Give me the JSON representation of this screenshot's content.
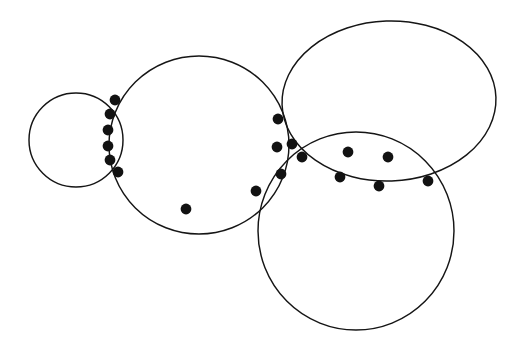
{
  "figure": {
    "background_color": "#ffffff",
    "stroke_color": "#151515",
    "dot_color": "#121212",
    "stroke_width": 1.45,
    "dot_radius": 5.4,
    "canvas": {
      "width": 519,
      "height": 351
    }
  },
  "chart_data": {
    "type": "scatter",
    "title": "",
    "xlabel": "",
    "ylabel": "",
    "xlim": [
      0,
      519
    ],
    "ylim": [
      0,
      351
    ],
    "grid": false,
    "legend": "none",
    "circles": [
      {
        "name": "small-left-circle",
        "cx": 76,
        "cy": 140,
        "rx": 47,
        "ry": 47,
        "rotate": 0
      },
      {
        "name": "large-middle-circle",
        "cx": 199,
        "cy": 145,
        "rx": 90,
        "ry": 89,
        "rotate": 0
      },
      {
        "name": "top-right-ellipse",
        "cx": 389,
        "cy": 101,
        "rx": 107,
        "ry": 80,
        "rotate": -2
      },
      {
        "name": "bottom-right-circle",
        "cx": 356,
        "cy": 231,
        "rx": 98,
        "ry": 99,
        "rotate": 0
      }
    ],
    "points": [
      {
        "id": "p1",
        "label": "left-chain-top",
        "x": 115,
        "y": 100
      },
      {
        "id": "p2",
        "label": "left-chain-2",
        "x": 110,
        "y": 114
      },
      {
        "id": "p3",
        "label": "left-chain-3",
        "x": 108,
        "y": 130
      },
      {
        "id": "p4",
        "label": "left-chain-4",
        "x": 108,
        "y": 146
      },
      {
        "id": "p5",
        "label": "left-chain-5",
        "x": 110,
        "y": 160
      },
      {
        "id": "p6",
        "label": "left-chain-bottom",
        "x": 118,
        "y": 172
      },
      {
        "id": "p7",
        "label": "middle-circle-bottom",
        "x": 186,
        "y": 209
      },
      {
        "id": "p8",
        "label": "cluster-top",
        "x": 278,
        "y": 119
      },
      {
        "id": "p9",
        "label": "cluster-left",
        "x": 277,
        "y": 147
      },
      {
        "id": "p10",
        "label": "cluster-upper-right",
        "x": 292,
        "y": 144
      },
      {
        "id": "p11",
        "label": "cluster-node",
        "x": 302,
        "y": 157
      },
      {
        "id": "p12",
        "label": "cluster-lower",
        "x": 281,
        "y": 174
      },
      {
        "id": "p13",
        "label": "lower-left-arc",
        "x": 256,
        "y": 191
      },
      {
        "id": "p14",
        "label": "lens-upper-left",
        "x": 348,
        "y": 152
      },
      {
        "id": "p15",
        "label": "lens-upper-right",
        "x": 388,
        "y": 157
      },
      {
        "id": "p16",
        "label": "lens-lower-left",
        "x": 340,
        "y": 177
      },
      {
        "id": "p17",
        "label": "lens-lower-right",
        "x": 379,
        "y": 186
      },
      {
        "id": "p18",
        "label": "lens-right-vertex",
        "x": 428,
        "y": 181
      }
    ]
  }
}
